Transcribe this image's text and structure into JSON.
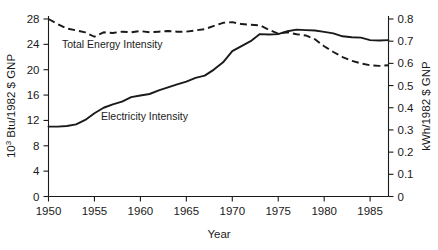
{
  "chart_data": {
    "type": "line",
    "title": "",
    "xlabel": "Year",
    "ylabel": "10³ Btu/1982 $ GNP",
    "ylabel_right": "kWh/1982 $ GNP",
    "xlim": [
      1950,
      1987
    ],
    "ylim": [
      0,
      28
    ],
    "ylim_right": [
      0,
      0.8
    ],
    "grid": false,
    "legend_position": "inline-annotations",
    "xticks": [
      1950,
      1955,
      1960,
      1965,
      1970,
      1975,
      1980,
      1985
    ],
    "xtick_labels": [
      "1950",
      "1955",
      "1960",
      "1965",
      "1970",
      "1975",
      "1980",
      "1985"
    ],
    "yticks_left": [
      0,
      4,
      8,
      12,
      16,
      20,
      24,
      28
    ],
    "ytick_labels_left": [
      "0",
      "4",
      "8",
      "12",
      "16",
      "20",
      "24",
      "28"
    ],
    "yticks_right": [
      0,
      0.1,
      0.2,
      0.3,
      0.4,
      0.5,
      0.6,
      0.7,
      0.8
    ],
    "ytick_labels_right": [
      "0",
      "0.1",
      "0.2",
      "0.3",
      "0.4",
      "0.5",
      "0.6",
      "0.7",
      "0.8"
    ],
    "x": [
      1950,
      1951,
      1952,
      1953,
      1954,
      1955,
      1956,
      1957,
      1958,
      1959,
      1960,
      1961,
      1962,
      1963,
      1964,
      1965,
      1966,
      1967,
      1968,
      1969,
      1970,
      1971,
      1972,
      1973,
      1974,
      1975,
      1976,
      1977,
      1978,
      1979,
      1980,
      1981,
      1982,
      1983,
      1984,
      1985,
      1986,
      1987
    ],
    "series": [
      {
        "name": "Total Energy Intensity",
        "axis": "left",
        "style": "dashed",
        "units": "10³ Btu/1982 $ GNP",
        "values": [
          28.0,
          27.2,
          26.5,
          26.2,
          25.9,
          25.2,
          25.9,
          25.8,
          26.0,
          25.9,
          26.1,
          25.9,
          26.0,
          26.1,
          26.0,
          26.0,
          26.2,
          26.4,
          26.9,
          27.4,
          27.5,
          27.2,
          27.1,
          27.0,
          26.3,
          25.7,
          25.9,
          25.6,
          25.4,
          24.8,
          23.7,
          22.8,
          22.0,
          21.4,
          21.0,
          20.7,
          20.6,
          20.7
        ]
      },
      {
        "name": "Electricity Intensity",
        "axis": "right",
        "style": "solid",
        "units": "kWh/1982 $ GNP",
        "values": [
          0.315,
          0.315,
          0.318,
          0.325,
          0.345,
          0.375,
          0.4,
          0.415,
          0.428,
          0.448,
          0.455,
          0.462,
          0.478,
          0.492,
          0.505,
          0.518,
          0.535,
          0.545,
          0.572,
          0.605,
          0.655,
          0.678,
          0.7,
          0.732,
          0.73,
          0.732,
          0.745,
          0.752,
          0.75,
          0.748,
          0.742,
          0.735,
          0.722,
          0.718,
          0.716,
          0.705,
          0.703,
          0.705
        ]
      }
    ],
    "annotations": [
      {
        "text": "Total Energy Intensity",
        "x_px": 62,
        "y_px": 48
      },
      {
        "text": "Electricity Intensity",
        "x_px": 101,
        "y_px": 120
      }
    ]
  }
}
